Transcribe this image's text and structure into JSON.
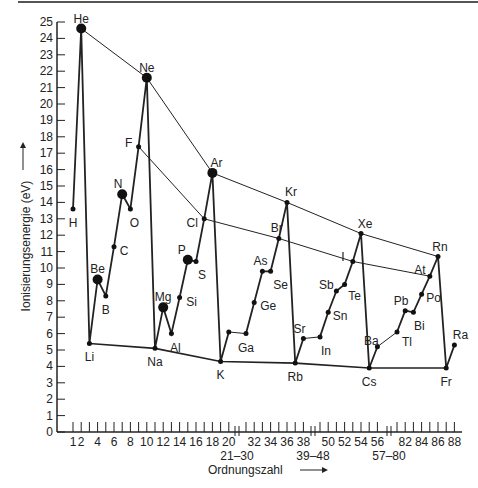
{
  "chart_data": {
    "type": "line",
    "title": "",
    "xlabel": "Ordnungszahl",
    "ylabel": "Ionisierungsenergie (eV)",
    "ylim": [
      0,
      25
    ],
    "yticks": [
      0,
      1,
      2,
      3,
      4,
      5,
      6,
      7,
      8,
      9,
      10,
      11,
      12,
      13,
      14,
      15,
      16,
      17,
      18,
      19,
      20,
      21,
      22,
      23,
      24,
      25
    ],
    "x_tick_labels": [
      "1",
      "2",
      "4",
      "6",
      "8",
      "10",
      "12",
      "14",
      "16",
      "18",
      "20",
      "32",
      "34",
      "36",
      "38",
      "50",
      "52",
      "54",
      "56",
      "82",
      "84",
      "86",
      "88"
    ],
    "x_break_labels": [
      "21–30",
      "39–48",
      "57–80"
    ],
    "grid": false,
    "points": [
      {
        "el": "H",
        "z": 1,
        "ie": 13.6
      },
      {
        "el": "He",
        "z": 2,
        "ie": 24.6
      },
      {
        "el": "Li",
        "z": 3,
        "ie": 5.4
      },
      {
        "el": "Be",
        "z": 4,
        "ie": 9.3
      },
      {
        "el": "B",
        "z": 5,
        "ie": 8.3
      },
      {
        "el": "C",
        "z": 6,
        "ie": 11.3
      },
      {
        "el": "N",
        "z": 7,
        "ie": 14.5
      },
      {
        "el": "O",
        "z": 8,
        "ie": 13.6
      },
      {
        "el": "F",
        "z": 9,
        "ie": 17.4
      },
      {
        "el": "Ne",
        "z": 10,
        "ie": 21.6
      },
      {
        "el": "Na",
        "z": 11,
        "ie": 5.1
      },
      {
        "el": "Mg",
        "z": 12,
        "ie": 7.6
      },
      {
        "el": "Al",
        "z": 13,
        "ie": 6.0
      },
      {
        "el": "Si",
        "z": 14,
        "ie": 8.2
      },
      {
        "el": "P",
        "z": 15,
        "ie": 10.5
      },
      {
        "el": "S",
        "z": 16,
        "ie": 10.4
      },
      {
        "el": "Cl",
        "z": 17,
        "ie": 13.0
      },
      {
        "el": "Ar",
        "z": 18,
        "ie": 15.8
      },
      {
        "el": "K",
        "z": 19,
        "ie": 4.3
      },
      {
        "el": "Ca",
        "z": 20,
        "ie": 6.1
      },
      {
        "el": "Ga",
        "z": 31,
        "ie": 6.0
      },
      {
        "el": "Ge",
        "z": 32,
        "ie": 7.9
      },
      {
        "el": "As",
        "z": 33,
        "ie": 9.8
      },
      {
        "el": "Se",
        "z": 34,
        "ie": 9.8
      },
      {
        "el": "Br",
        "z": 35,
        "ie": 11.8
      },
      {
        "el": "Kr",
        "z": 36,
        "ie": 14.0
      },
      {
        "el": "Rb",
        "z": 37,
        "ie": 4.2
      },
      {
        "el": "Sr",
        "z": 38,
        "ie": 5.7
      },
      {
        "el": "In",
        "z": 49,
        "ie": 5.8
      },
      {
        "el": "Sn",
        "z": 50,
        "ie": 7.3
      },
      {
        "el": "Sb",
        "z": 51,
        "ie": 8.6
      },
      {
        "el": "Te",
        "z": 52,
        "ie": 9.0
      },
      {
        "el": "I",
        "z": 53,
        "ie": 10.4
      },
      {
        "el": "Xe",
        "z": 54,
        "ie": 12.1
      },
      {
        "el": "Cs",
        "z": 55,
        "ie": 3.9
      },
      {
        "el": "Ba",
        "z": 56,
        "ie": 5.2
      },
      {
        "el": "Tl",
        "z": 81,
        "ie": 6.1
      },
      {
        "el": "Pb",
        "z": 82,
        "ie": 7.4
      },
      {
        "el": "Bi",
        "z": 83,
        "ie": 7.3
      },
      {
        "el": "Po",
        "z": 84,
        "ie": 8.4
      },
      {
        "el": "At",
        "z": 85,
        "ie": 9.5
      },
      {
        "el": "Rn",
        "z": 86,
        "ie": 10.7
      },
      {
        "el": "Fr",
        "z": 87,
        "ie": 3.9
      },
      {
        "el": "Ra",
        "z": 88,
        "ie": 5.3
      }
    ],
    "noble_gas_trend": [
      "He",
      "Ne",
      "Ar",
      "Kr",
      "Xe",
      "Rn"
    ],
    "halogen_trend": [
      "F",
      "Cl",
      "Br",
      "I",
      "At"
    ],
    "alkali_trend": [
      "Li",
      "Na",
      "K",
      "Rb",
      "Cs",
      "Fr"
    ],
    "large_markers": [
      "He",
      "Ne",
      "Ar",
      "N",
      "Be",
      "P",
      "Mg"
    ],
    "annotations": [
      "Ionisierungsenergie (eV) →",
      "Ordnungszahl →"
    ]
  },
  "labels": {
    "ylabel": "Ionisierungsenergie (eV)",
    "xlabel": "Ordnungszahl"
  }
}
